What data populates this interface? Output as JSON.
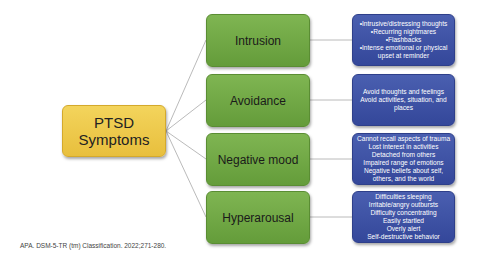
{
  "root": {
    "line1": "PTSD",
    "line2": "Symptoms"
  },
  "categories": [
    {
      "label": "Intrusion",
      "details": [
        "•Intrusive/distressing thoughts",
        "•Recurring nightmares",
        "•Flashbacks",
        "•Intense emotional or physical",
        "upset at reminder"
      ]
    },
    {
      "label": "Avoidance",
      "details": [
        "Avoid thoughts and feelings",
        "Avoid activities, situation, and",
        "places"
      ]
    },
    {
      "label": "Negative mood",
      "details": [
        "Cannot recall aspects of trauma",
        "Lost interest in activities",
        "Detached from others",
        "Impaired range of emotions",
        "Negative beliefs about self,",
        "others, and the world"
      ]
    },
    {
      "label": "Hyperarousal",
      "details": [
        "Difficulties sleeping",
        "Irritable/angry outbursts",
        "Difficulty concentrating",
        "Easily startled",
        "Overly alert",
        "Self-destructive behavior"
      ]
    }
  ],
  "citation": "APA. DSM-5-TR (tm) Classification. 2022;271-280.",
  "colors": {
    "root": "#ecc546",
    "category": "#6fa644",
    "detail": "#3d51a3",
    "connector": "#a8a8a8"
  }
}
